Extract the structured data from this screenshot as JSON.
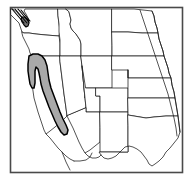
{
  "figure": {
    "type": "distribution-range-map",
    "region_title": "Western United States",
    "background_color": "#ffffff",
    "frame_color": "#4a4a4a",
    "state_outline_color": "#1a1a1a",
    "range_fill_color": "#a9a9a9",
    "range_outline_color": "#000000",
    "secondary_range_fill_color": "#6e6e6e"
  },
  "frame": {
    "x": 10,
    "y": 7,
    "width": 172,
    "height": 165
  },
  "legend": {
    "shaded_area_meaning": "Shaded gray area indicates species distribution range",
    "visible_labels": []
  },
  "range_areas": [
    {
      "name": "california-central-valley-sierra-range",
      "fill": "#a9a9a9",
      "description": "Elongated shaded band extending from northern California south through the Central Valley and Sierra Nevada to southern California"
    },
    {
      "name": "puget-sound-range",
      "fill": "#6e6e6e",
      "description": "Small dark shaded patch in northwestern Washington near Puget Sound"
    }
  ],
  "states": [
    {
      "name": "washington",
      "label": "Washington"
    },
    {
      "name": "oregon",
      "label": "Oregon"
    },
    {
      "name": "california",
      "label": "California"
    },
    {
      "name": "idaho",
      "label": "Idaho"
    },
    {
      "name": "nevada",
      "label": "Nevada"
    },
    {
      "name": "montana",
      "label": "Montana"
    },
    {
      "name": "wyoming",
      "label": "Wyoming"
    },
    {
      "name": "utah",
      "label": "Utah"
    },
    {
      "name": "arizona",
      "label": "Arizona"
    },
    {
      "name": "colorado",
      "label": "Colorado"
    },
    {
      "name": "new-mexico",
      "label": "New Mexico"
    },
    {
      "name": "north-dakota",
      "label": "North Dakota"
    },
    {
      "name": "south-dakota",
      "label": "South Dakota"
    },
    {
      "name": "nebraska",
      "label": "Nebraska"
    },
    {
      "name": "kansas",
      "label": "Kansas"
    },
    {
      "name": "oklahoma",
      "label": "Oklahoma"
    },
    {
      "name": "texas",
      "label": "Texas"
    }
  ]
}
